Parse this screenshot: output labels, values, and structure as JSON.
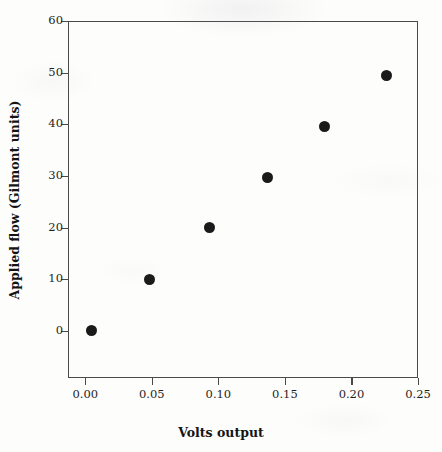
{
  "chart_data": {
    "type": "scatter",
    "title": "",
    "xlabel": "Volts output",
    "ylabel": "Applied flow (Gilmont units)",
    "xlim": [
      -0.013,
      0.25
    ],
    "ylim": [
      -9.1,
      60
    ],
    "xticks": [
      0.0,
      0.05,
      0.1,
      0.15,
      0.2,
      0.25
    ],
    "xtick_labels": [
      "0.00",
      "0.05",
      "0.10",
      "0.15",
      "0.20",
      "0.25"
    ],
    "yticks": [
      0,
      10,
      20,
      30,
      40,
      50,
      60
    ],
    "ytick_labels": [
      "0",
      "10",
      "20",
      "30",
      "40",
      "50",
      "60"
    ],
    "grid": false,
    "legend": null,
    "marker": {
      "shape": "circle",
      "filled": true,
      "color": "#1a1a1a",
      "size_px": 11
    },
    "series": [
      {
        "name": "Applied flow vs Volts output",
        "x": [
          0.005,
          0.048,
          0.093,
          0.137,
          0.18,
          0.226
        ],
        "y": [
          0.0,
          10.0,
          20.0,
          29.7,
          39.6,
          49.5
        ]
      }
    ]
  },
  "figure": {
    "frame_color": "#4a4a4a",
    "background": "#fdfdfc",
    "text_color": "#1d1d1d"
  }
}
